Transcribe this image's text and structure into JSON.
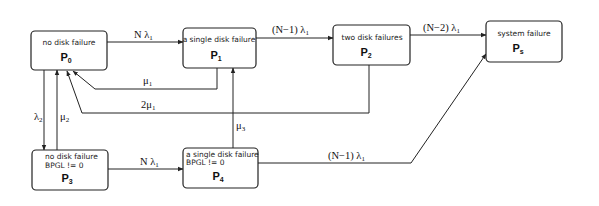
{
  "diagram": {
    "type": "markov-state-transition",
    "nodes": [
      {
        "id": "P0",
        "line1": "no disk failure",
        "line2": "",
        "name": "P",
        "sub": "0"
      },
      {
        "id": "P1",
        "line1": "a single disk failure",
        "line2": "",
        "name": "P",
        "sub": "1"
      },
      {
        "id": "P2",
        "line1": "two disk failures",
        "line2": "",
        "name": "P",
        "sub": "2"
      },
      {
        "id": "Ps",
        "line1": "system failure",
        "line2": "",
        "name": "P",
        "sub": "s"
      },
      {
        "id": "P3",
        "line1": "no disk failure",
        "line2": "BPGL != 0",
        "name": "P",
        "sub": "3"
      },
      {
        "id": "P4",
        "line1": "a single disk failure",
        "line2": "BPGL != 0",
        "name": "P",
        "sub": "4"
      }
    ],
    "edges": [
      {
        "from": "P0",
        "to": "P1",
        "label": "N λ",
        "sub": "1"
      },
      {
        "from": "P1",
        "to": "P2",
        "label": "(N−1) λ",
        "sub": "1"
      },
      {
        "from": "P2",
        "to": "Ps",
        "label": "(N−2) λ",
        "sub": "1"
      },
      {
        "from": "P1",
        "to": "P0",
        "label": "μ",
        "sub": "1"
      },
      {
        "from": "P2",
        "to": "P0",
        "label": "2μ",
        "sub": "1"
      },
      {
        "from": "P0",
        "to": "P3",
        "label": "λ",
        "sub": "2"
      },
      {
        "from": "P3",
        "to": "P0",
        "label": "μ",
        "sub": "2"
      },
      {
        "from": "P4",
        "to": "P1",
        "label": "μ",
        "sub": "3"
      },
      {
        "from": "P3",
        "to": "P4",
        "label": "N λ",
        "sub": "1"
      },
      {
        "from": "P4",
        "to": "Ps",
        "label": "(N−1) λ",
        "sub": "1"
      }
    ]
  }
}
